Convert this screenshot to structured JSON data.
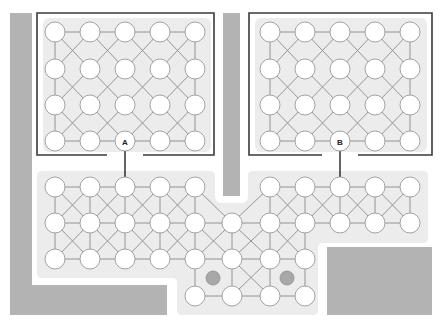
{
  "diagram": {
    "type": "network-topology",
    "colors": {
      "wall": "#b3b3b3",
      "region": "#ececec",
      "border": "#3a3a3a",
      "edge": "#8a8a8a",
      "node_fill": "#ffffff",
      "marker": "#a8a8a8"
    },
    "walls": [
      {
        "id": "left-wall-vertical",
        "x": 10,
        "y": 13,
        "w": 22,
        "h": 302
      },
      {
        "id": "left-wall-bottom",
        "x": 10,
        "y": 285,
        "w": 157,
        "h": 30
      },
      {
        "id": "middle-wall",
        "x": 223,
        "y": 13,
        "w": 17,
        "h": 183
      },
      {
        "id": "right-bottom-block",
        "x": 327,
        "y": 247,
        "w": 105,
        "h": 68
      }
    ],
    "boxes": [
      {
        "id": "box-left",
        "frame": {
          "x": 37,
          "y": 13,
          "w": 177,
          "h": 142
        },
        "gap": [
          107,
          143
        ],
        "gateway": {
          "label": "A",
          "x": 125,
          "y": 141
        }
      },
      {
        "id": "box-right",
        "frame": {
          "x": 249,
          "y": 13,
          "w": 183,
          "h": 142
        },
        "gap": [
          322,
          358
        ],
        "gateway": {
          "label": "B",
          "x": 340,
          "y": 141
        }
      }
    ],
    "labels": {
      "gateway_a": "A",
      "gateway_b": "B"
    },
    "grid_left": {
      "cols": [
        55,
        90,
        125,
        160,
        195
      ],
      "rows": [
        32,
        69,
        105,
        141
      ]
    },
    "grid_right": {
      "cols": [
        270,
        305,
        340,
        375,
        410
      ],
      "rows": [
        32,
        69,
        105,
        141
      ]
    },
    "bottom_nodes": {
      "row1_left": [
        55,
        90,
        125,
        160,
        195
      ],
      "row1_right": [
        270,
        305,
        340,
        375,
        410
      ],
      "row2": [
        55,
        90,
        125,
        160,
        195,
        232,
        270,
        305,
        340,
        375,
        410
      ],
      "row3": [
        55,
        90,
        125,
        160,
        195,
        232,
        270,
        305
      ],
      "row4": [
        195,
        232,
        270,
        305
      ],
      "y": [
        187,
        223,
        259,
        296
      ]
    },
    "markers": [
      {
        "x": 213,
        "y": 278
      },
      {
        "x": 287,
        "y": 278
      }
    ],
    "node_radius": 10
  }
}
